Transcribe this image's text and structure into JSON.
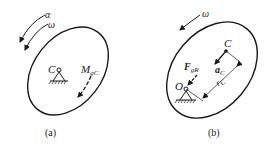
{
  "figure_a": {
    "caption": "(a)",
    "labels": {
      "alpha": "α",
      "omega": "ω",
      "center": "C",
      "moment": "M",
      "moment_sub": "gC"
    }
  },
  "figure_b": {
    "caption": "(b)",
    "labels": {
      "omega": "ω",
      "center": "C",
      "pivot": "O",
      "force": "F",
      "force_sub": "gR",
      "accel": "a",
      "accel_sub": "C",
      "distance": "r",
      "distance_sub": "C"
    }
  },
  "colors": {
    "stroke": "#1a1a1a",
    "background": "#ffffff"
  }
}
